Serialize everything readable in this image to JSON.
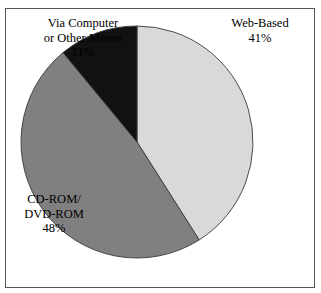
{
  "figure": {
    "caption_remnant": "",
    "frame_border_color": "#555555",
    "background_color": "#ffffff"
  },
  "chart_data": {
    "type": "pie",
    "title": "",
    "subtitle": "",
    "xlabel": "",
    "ylabel": "",
    "legend_position": "none",
    "grid": false,
    "start_angle_deg": 0,
    "direction": "clockwise",
    "units": "percent",
    "total": 100,
    "categories": [
      "Web-Based",
      "CD-ROM/ DVD-ROM",
      "Via Computer or Other Means"
    ],
    "values": [
      41,
      48,
      11
    ],
    "value_labels": [
      "41%",
      "48%",
      "11%"
    ],
    "colors": [
      "#d9d9d9",
      "#808080",
      "#111111"
    ],
    "slices": [
      {
        "name": "Web-Based",
        "value": 41,
        "value_label": "41%",
        "color": "#d9d9d9",
        "label_lines": [
          "Web-Based",
          "41%"
        ]
      },
      {
        "name": "CD-ROM/ DVD-ROM",
        "value": 48,
        "value_label": "48%",
        "color": "#808080",
        "label_lines": [
          "CD-ROM/",
          "DVD-ROM",
          "48%"
        ]
      },
      {
        "name": "Via Computer or Other Means",
        "value": 11,
        "value_label": "11%",
        "color": "#111111",
        "label_lines": [
          "Via Computer",
          "or Other Means",
          "11%"
        ]
      }
    ]
  },
  "labels": {
    "via_computer": {
      "line1": "Via Computer",
      "line2": "or Other Means",
      "line3": "11%"
    },
    "web_based": {
      "line1": "Web-Based",
      "line2": "41%"
    },
    "cdrom": {
      "line1": "CD-ROM/",
      "line2": "DVD-ROM",
      "line3": "48%"
    }
  }
}
